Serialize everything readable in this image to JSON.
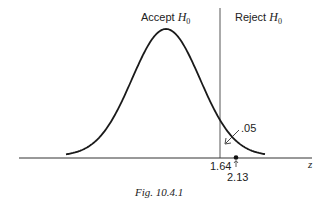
{
  "figure": {
    "caption": "Fig. 10.4.1",
    "region_labels": {
      "accept": {
        "prefix": "Accept ",
        "symbol": "H",
        "subscript": "0"
      },
      "reject": {
        "prefix": "Reject ",
        "symbol": "H",
        "subscript": "0"
      }
    },
    "axis": {
      "variable_label": "z",
      "critical_value_label": "1.64",
      "observed_value_label": "2.13"
    },
    "tail_area_label": ".05",
    "colors": {
      "line": "#222222",
      "background": "#ffffff"
    }
  },
  "chart_data": {
    "type": "line",
    "title": "Fig. 10.4.1",
    "xlabel": "z",
    "ylabel": "",
    "series": [
      {
        "name": "Standard normal density",
        "distribution": "N(0,1)"
      }
    ],
    "critical_value": 1.64,
    "observed_value": 2.13,
    "tail_area": 0.05,
    "regions": [
      {
        "name": "Accept H0",
        "range": "z < 1.64"
      },
      {
        "name": "Reject H0",
        "range": "z >= 1.64"
      }
    ],
    "annotations": [
      ".05",
      "1.64",
      "2.13",
      "Accept H0",
      "Reject H0"
    ],
    "grid": false
  }
}
